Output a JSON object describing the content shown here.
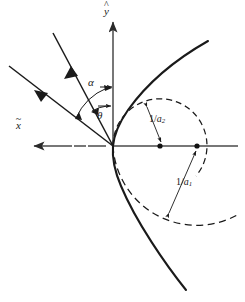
{
  "figure": {
    "background_color": "#ffffff",
    "stroke_color": "#1a1a1a",
    "axis_color": "#555555"
  },
  "axes": {
    "x_axis": {
      "label_base": "x",
      "label_accent": "~",
      "label_full": "x̃",
      "direction": "left",
      "arrow": "arrowhead-left"
    },
    "y_axis": {
      "label_base": "y",
      "label_accent": "^",
      "label_full": "ŷ",
      "direction": "up",
      "arrow": "arrowhead-up"
    },
    "origin": {
      "x": 113,
      "y": 146
    }
  },
  "angles": [
    {
      "name": "alpha",
      "symbol": "α",
      "between": "y-axis and outer ray"
    },
    {
      "name": "theta",
      "symbol": "θ",
      "between": "y-axis and inner ray"
    }
  ],
  "rays": [
    {
      "name": "outer-ray",
      "direction": "up-left",
      "arrow": "outgoing",
      "angle_label": "α"
    },
    {
      "name": "inner-ray",
      "direction": "up-left",
      "arrow": "incoming",
      "angle_label": "θ"
    }
  ],
  "radii": [
    {
      "name": "radius-2",
      "numerator": "1",
      "slash": "/",
      "denominator": "a",
      "subscript": "2",
      "label_full": "1/a₂",
      "center": {
        "x": 160,
        "y": 146
      },
      "style": "dashed"
    },
    {
      "name": "radius-1",
      "numerator": "1",
      "slash": "/",
      "denominator": "a",
      "subscript": "1",
      "label_full": "1/a₁",
      "center": {
        "x": 197,
        "y": 146
      },
      "style": "dashed"
    }
  ],
  "curves": [
    {
      "name": "solid-hyperbola",
      "style": "solid",
      "opens": "right"
    },
    {
      "name": "dashed-circle-small",
      "style": "dashed"
    },
    {
      "name": "dashed-circle-large",
      "style": "dashed"
    }
  ],
  "markers": [
    {
      "name": "center-dot-a2",
      "x": 160,
      "y": 146
    },
    {
      "name": "center-dot-a1",
      "x": 197,
      "y": 146
    }
  ],
  "caption": {
    "text": ""
  }
}
